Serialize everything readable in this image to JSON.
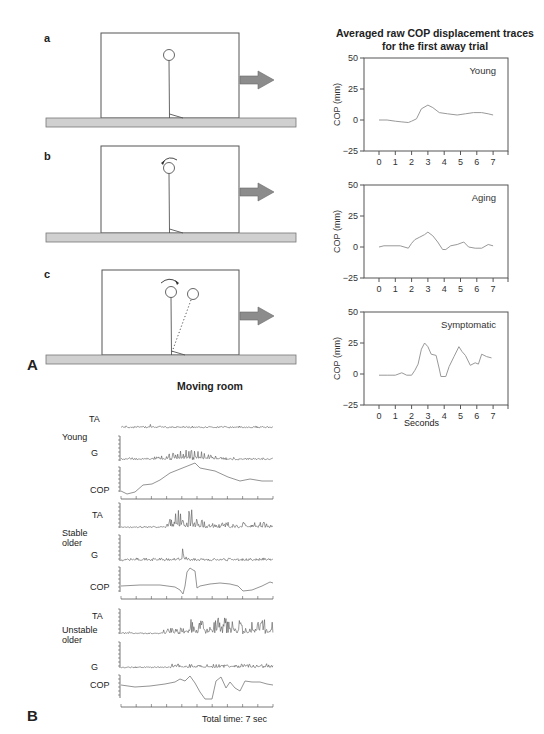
{
  "panel_A": {
    "label": "A",
    "scenes": [
      {
        "letter": "a",
        "description": "Standing upright in moving room, room moves away",
        "sway": "none"
      },
      {
        "letter": "b",
        "description": "Room moves away; subject perceives backward sway (counterclockwise arrow over head)",
        "sway": "perceived"
      },
      {
        "letter": "c",
        "description": "Subject compensates by swaying forward (clockwise arrow, dotted leaning figure)",
        "sway": "compensatory"
      }
    ],
    "chart_title_line1": "Averaged raw COP displacement traces",
    "chart_title_line2": "for the first away trial",
    "x_axis_label": "Seconds",
    "y_axis_label": "COP (mm)",
    "y_ticks": [
      "50",
      "25",
      "0",
      "−25"
    ],
    "x_ticks": [
      "0",
      "1",
      "2",
      "3",
      "4",
      "5",
      "6",
      "7"
    ]
  },
  "panel_B": {
    "label": "B",
    "title": "Moving room",
    "groups": [
      {
        "name_line1": "Young",
        "name_line2": "",
        "channels": [
          "TA",
          "G",
          "COP"
        ]
      },
      {
        "name_line1": "Stable",
        "name_line2": "older",
        "channels": [
          "TA",
          "G",
          "COP"
        ]
      },
      {
        "name_line1": "Unstable",
        "name_line2": "older",
        "channels": [
          "TA",
          "G",
          "COP"
        ]
      }
    ],
    "footer": "Total time: 7 sec"
  },
  "chart_data": [
    {
      "type": "line",
      "title": "Young",
      "xlabel": "Seconds",
      "ylabel": "COP (mm)",
      "xlim": [
        -0.8,
        8.0
      ],
      "ylim": [
        -25,
        50
      ],
      "x": [
        0,
        0.5,
        1.0,
        1.4,
        1.8,
        2.0,
        2.3,
        2.6,
        3.0,
        3.3,
        3.7,
        4.2,
        4.8,
        5.3,
        5.8,
        6.3,
        6.7,
        7.0
      ],
      "values": [
        0,
        0,
        -1,
        -1.5,
        -2,
        -1,
        1,
        9,
        12,
        10,
        6,
        5,
        4,
        5,
        6,
        6,
        5,
        4
      ]
    },
    {
      "type": "line",
      "title": "Aging",
      "xlabel": "Seconds",
      "ylabel": "COP (mm)",
      "xlim": [
        -0.8,
        8.0
      ],
      "ylim": [
        -25,
        50
      ],
      "x": [
        0,
        0.3,
        0.8,
        1.3,
        1.8,
        2.0,
        2.2,
        2.5,
        2.8,
        3.0,
        3.3,
        3.6,
        3.9,
        4.1,
        4.4,
        4.8,
        5.2,
        5.5,
        5.9,
        6.3,
        6.7,
        7.0
      ],
      "values": [
        0,
        1,
        1,
        1,
        -1,
        3,
        6,
        8,
        10,
        12,
        9,
        4,
        -2,
        -2,
        1,
        2,
        4,
        0,
        -1,
        -1,
        2,
        1
      ]
    },
    {
      "type": "line",
      "title": "Symptomatic",
      "xlabel": "Seconds",
      "ylabel": "COP (mm)",
      "xlim": [
        -0.8,
        8.0
      ],
      "ylim": [
        -25,
        50
      ],
      "x": [
        0,
        0.5,
        1.0,
        1.4,
        1.7,
        2.0,
        2.2,
        2.4,
        2.6,
        2.8,
        3.0,
        3.2,
        3.5,
        3.7,
        3.8,
        4.1,
        4.3,
        4.6,
        4.9,
        5.1,
        5.3,
        5.6,
        5.9,
        6.1,
        6.3,
        6.6,
        6.9
      ],
      "values": [
        -1,
        -1,
        -1,
        1,
        -1,
        -1,
        3,
        8,
        20,
        25,
        22,
        16,
        15,
        4,
        -2,
        -2,
        6,
        14,
        22,
        18,
        15,
        7,
        9,
        8,
        16,
        14,
        13
      ]
    }
  ]
}
